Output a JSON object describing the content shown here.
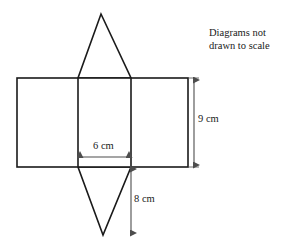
{
  "figure": {
    "type": "geometry-net-diagram",
    "note_text": "Diagrams not drawn to scale",
    "note_line_1": "Diagrams not",
    "note_line_2": "drawn to scale",
    "stroke_color": "#1a1a1a",
    "fill_color": "#ffffff",
    "dimension_arrow_color": "#4d4d4d"
  },
  "dimensions": [
    {
      "id": "width",
      "label": "6 cm",
      "value": 6,
      "unit": "cm",
      "orientation": "horizontal",
      "measures": "width of middle rectangle / triangle base"
    },
    {
      "id": "height",
      "label": "9 cm",
      "value": 9,
      "unit": "cm",
      "orientation": "vertical",
      "measures": "height of rectangles"
    },
    {
      "id": "slant",
      "label": "8 cm",
      "value": 8,
      "unit": "cm",
      "orientation": "vertical",
      "measures": "height of lower triangle"
    }
  ],
  "geometry": {
    "rectangle_band": {
      "x": 17,
      "y": 78,
      "width": 171,
      "height": 89
    },
    "divider_x": [
      78,
      131
    ],
    "triangle_top": {
      "apex_x": 101,
      "apex_y": 14,
      "base_left_x": 78,
      "base_right_x": 131,
      "base_y": 78
    },
    "triangle_bottom": {
      "apex_x": 103,
      "apex_y": 235,
      "base_left_x": 78,
      "base_right_x": 131,
      "base_y": 167
    },
    "arrow_6cm": {
      "x1": 78,
      "x2": 131,
      "y": 157
    },
    "arrow_9cm": {
      "x": 194,
      "y1": 78,
      "y2": 167
    },
    "arrow_8cm": {
      "x": 131,
      "y1": 167,
      "y2": 235
    }
  }
}
